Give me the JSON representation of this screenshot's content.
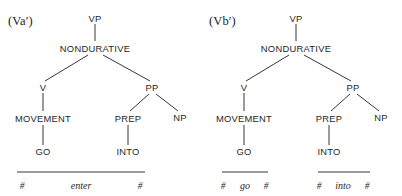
{
  "figures": [
    {
      "id": "va",
      "label": "(Va′)",
      "label_x": 8,
      "label_y": 14,
      "nodes": [
        {
          "name": "vp",
          "text": "VP",
          "x": 95,
          "y": 18
        },
        {
          "name": "nondurative",
          "text": "NONDURATIVE",
          "x": 95,
          "y": 48
        },
        {
          "name": "v",
          "text": "V",
          "x": 43,
          "y": 87
        },
        {
          "name": "pp",
          "text": "PP",
          "x": 152,
          "y": 87
        },
        {
          "name": "movement",
          "text": "MOVEMENT",
          "x": 43,
          "y": 118
        },
        {
          "name": "prep",
          "text": "PREP",
          "x": 128,
          "y": 118
        },
        {
          "name": "np",
          "text": "NP",
          "x": 180,
          "y": 117
        },
        {
          "name": "go",
          "text": "GO",
          "x": 43,
          "y": 151
        },
        {
          "name": "into",
          "text": "INTO",
          "x": 128,
          "y": 151
        }
      ],
      "edges": [
        {
          "name": "vp-to-nondurative",
          "x1": 95,
          "y1": 24,
          "x2": 95,
          "y2": 41
        },
        {
          "name": "nondurative-to-v",
          "x1": 88,
          "y1": 55,
          "x2": 45,
          "y2": 81
        },
        {
          "name": "nondurative-to-pp",
          "x1": 103,
          "y1": 55,
          "x2": 150,
          "y2": 81
        },
        {
          "name": "v-to-movement",
          "x1": 43,
          "y1": 93,
          "x2": 43,
          "y2": 111
        },
        {
          "name": "movement-to-go",
          "x1": 43,
          "y1": 125,
          "x2": 43,
          "y2": 145
        },
        {
          "name": "pp-to-prep",
          "x1": 149,
          "y1": 94,
          "x2": 130,
          "y2": 111
        },
        {
          "name": "pp-to-np",
          "x1": 156,
          "y1": 94,
          "x2": 178,
          "y2": 111
        },
        {
          "name": "prep-to-into",
          "x1": 128,
          "y1": 125,
          "x2": 128,
          "y2": 145
        }
      ],
      "phon_rules": [
        {
          "name": "phon-bar-enter",
          "x1": 17,
          "x2": 145,
          "y": 172
        }
      ],
      "phon_items": [
        {
          "name": "boundary-left",
          "kind": "boundary",
          "text": "#",
          "x": 22,
          "y": 186
        },
        {
          "name": "word-enter",
          "kind": "word",
          "text": "enter",
          "x": 81,
          "y": 185
        },
        {
          "name": "boundary-right",
          "kind": "boundary",
          "text": "#",
          "x": 140,
          "y": 186
        }
      ]
    },
    {
      "id": "vb",
      "label": "(Vb′)",
      "label_x": 8,
      "label_y": 14,
      "nodes": [
        {
          "name": "vp",
          "text": "VP",
          "x": 95,
          "y": 18
        },
        {
          "name": "nondurative",
          "text": "NONDURATIVE",
          "x": 95,
          "y": 48
        },
        {
          "name": "v",
          "text": "V",
          "x": 43,
          "y": 87
        },
        {
          "name": "pp",
          "text": "PP",
          "x": 152,
          "y": 87
        },
        {
          "name": "movement",
          "text": "MOVEMENT",
          "x": 43,
          "y": 118
        },
        {
          "name": "prep",
          "text": "PREP",
          "x": 128,
          "y": 118
        },
        {
          "name": "np",
          "text": "NP",
          "x": 180,
          "y": 117
        },
        {
          "name": "go",
          "text": "GO",
          "x": 43,
          "y": 151
        },
        {
          "name": "into",
          "text": "INTO",
          "x": 128,
          "y": 151
        }
      ],
      "edges": [
        {
          "name": "vp-to-nondurative",
          "x1": 95,
          "y1": 24,
          "x2": 95,
          "y2": 41
        },
        {
          "name": "nondurative-to-v",
          "x1": 88,
          "y1": 55,
          "x2": 45,
          "y2": 81
        },
        {
          "name": "nondurative-to-pp",
          "x1": 103,
          "y1": 55,
          "x2": 150,
          "y2": 81
        },
        {
          "name": "v-to-movement",
          "x1": 43,
          "y1": 93,
          "x2": 43,
          "y2": 111
        },
        {
          "name": "movement-to-go",
          "x1": 43,
          "y1": 125,
          "x2": 43,
          "y2": 145
        },
        {
          "name": "pp-to-prep",
          "x1": 149,
          "y1": 94,
          "x2": 130,
          "y2": 111
        },
        {
          "name": "pp-to-np",
          "x1": 156,
          "y1": 94,
          "x2": 178,
          "y2": 111
        },
        {
          "name": "prep-to-into",
          "x1": 128,
          "y1": 125,
          "x2": 128,
          "y2": 145
        }
      ],
      "phon_rules": [
        {
          "name": "phon-bar-go",
          "x1": 21,
          "x2": 67,
          "y": 172
        },
        {
          "name": "phon-bar-into",
          "x1": 117,
          "x2": 169,
          "y": 172
        }
      ],
      "phon_items": [
        {
          "name": "boundary-go-left",
          "kind": "boundary",
          "text": "#",
          "x": 22,
          "y": 186
        },
        {
          "name": "word-go",
          "kind": "word",
          "text": "go",
          "x": 44,
          "y": 185
        },
        {
          "name": "boundary-go-right",
          "kind": "boundary",
          "text": "#",
          "x": 65,
          "y": 186
        },
        {
          "name": "boundary-into-left",
          "kind": "boundary",
          "text": "#",
          "x": 118,
          "y": 186
        },
        {
          "name": "word-into",
          "kind": "word",
          "text": "into",
          "x": 142,
          "y": 185
        },
        {
          "name": "boundary-into-right",
          "kind": "boundary",
          "text": "#",
          "x": 166,
          "y": 186
        }
      ]
    }
  ],
  "style": {
    "ink": "#1f1f1f",
    "background": "#ffffff",
    "stroke_width": 0.9
  }
}
